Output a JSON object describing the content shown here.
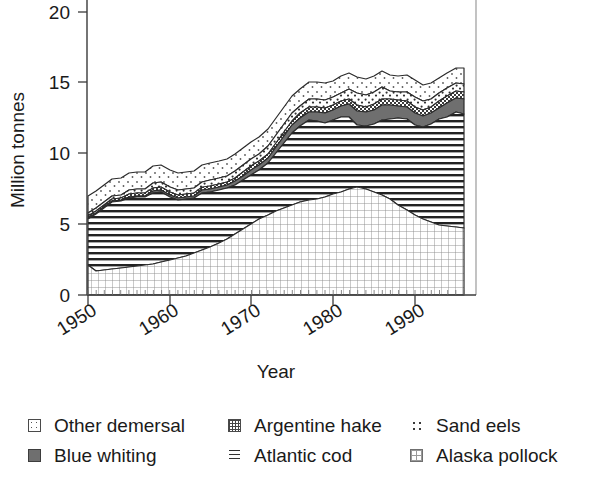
{
  "chart_data": {
    "type": "area",
    "stacked": true,
    "title": "",
    "xlabel": "Year",
    "ylabel": "Million tonnes",
    "xlim": [
      1950,
      1996
    ],
    "ylim": [
      0,
      21.5
    ],
    "yticks": [
      0,
      5,
      10,
      15,
      20
    ],
    "xticks": [
      1950,
      1960,
      1970,
      1980,
      1990
    ],
    "grid": false,
    "legend_position": "below",
    "x": [
      1950,
      1951,
      1952,
      1953,
      1954,
      1955,
      1956,
      1957,
      1958,
      1959,
      1960,
      1961,
      1962,
      1963,
      1964,
      1965,
      1966,
      1967,
      1968,
      1969,
      1970,
      1971,
      1972,
      1973,
      1974,
      1975,
      1976,
      1977,
      1978,
      1979,
      1980,
      1981,
      1982,
      1983,
      1984,
      1985,
      1986,
      1987,
      1988,
      1989,
      1990,
      1991,
      1992,
      1993,
      1994,
      1995,
      1996
    ],
    "series": [
      {
        "name": "Alaska pollock",
        "pattern": "fine-grid",
        "values": [
          0.0,
          0.0,
          0.0,
          0.0,
          0.0,
          0.0,
          0.05,
          0.1,
          0.1,
          0.15,
          0.2,
          0.3,
          0.4,
          0.5,
          0.6,
          0.7,
          0.8,
          1.0,
          1.3,
          1.6,
          2.0,
          2.4,
          2.8,
          3.1,
          3.3,
          3.5,
          3.5,
          3.4,
          3.4,
          3.5,
          3.7,
          4.0,
          4.3,
          4.6,
          5.0,
          5.4,
          5.9,
          6.4,
          6.7,
          6.3,
          5.8,
          5.3,
          5.0,
          4.8,
          4.6,
          4.6,
          4.7
        ]
      },
      {
        "name": "Atlantic cod",
        "pattern": "horizontal-lines",
        "values": [
          2.1,
          2.2,
          2.3,
          2.2,
          2.3,
          2.4,
          2.5,
          2.4,
          2.4,
          2.5,
          2.6,
          2.7,
          2.8,
          2.9,
          3.0,
          3.1,
          3.1,
          3.2,
          3.3,
          3.0,
          3.1,
          3.0,
          2.9,
          2.7,
          2.6,
          2.6,
          2.5,
          2.3,
          2.2,
          2.1,
          2.0,
          2.0,
          2.1,
          2.2,
          2.3,
          2.2,
          2.1,
          2.0,
          1.9,
          1.8,
          1.7,
          1.6,
          1.4,
          1.2,
          1.1,
          1.0,
          1.0
        ]
      },
      {
        "name": "Blue whiting",
        "pattern": "solid-gray",
        "values": [
          0.0,
          0.0,
          0.0,
          0.0,
          0.0,
          0.0,
          0.0,
          0.0,
          0.0,
          0.0,
          0.05,
          0.05,
          0.1,
          0.1,
          0.1,
          0.15,
          0.2,
          0.2,
          0.25,
          0.3,
          0.3,
          0.4,
          0.5,
          0.6,
          0.7,
          0.7,
          0.6,
          0.5,
          0.5,
          0.6,
          0.7,
          0.8,
          0.9,
          1.0,
          1.0,
          0.9,
          0.9,
          1.0,
          1.1,
          1.0,
          0.9,
          0.8,
          0.8,
          0.8,
          0.9,
          1.0,
          1.1
        ]
      },
      {
        "name": "Argentine hake",
        "pattern": "checkered",
        "values": [
          0.05,
          0.05,
          0.05,
          0.05,
          0.1,
          0.1,
          0.1,
          0.1,
          0.1,
          0.1,
          0.1,
          0.1,
          0.1,
          0.15,
          0.15,
          0.15,
          0.2,
          0.2,
          0.2,
          0.2,
          0.25,
          0.25,
          0.3,
          0.3,
          0.3,
          0.3,
          0.35,
          0.35,
          0.35,
          0.35,
          0.4,
          0.4,
          0.4,
          0.4,
          0.4,
          0.4,
          0.4,
          0.4,
          0.45,
          0.45,
          0.45,
          0.45,
          0.45,
          0.45,
          0.5,
          0.5,
          0.5
        ]
      },
      {
        "name": "Sand eels",
        "pattern": "sparse-dots",
        "values": [
          0.05,
          0.05,
          0.05,
          0.05,
          0.05,
          0.05,
          0.1,
          0.1,
          0.1,
          0.1,
          0.15,
          0.15,
          0.2,
          0.2,
          0.25,
          0.3,
          0.35,
          0.4,
          0.45,
          0.5,
          0.5,
          0.55,
          0.6,
          0.6,
          0.6,
          0.6,
          0.6,
          0.6,
          0.6,
          0.6,
          0.6,
          0.6,
          0.6,
          0.65,
          0.7,
          0.75,
          0.8,
          0.85,
          0.85,
          0.8,
          0.7,
          0.65,
          0.6,
          0.6,
          0.6,
          0.6,
          0.6
        ]
      },
      {
        "name": "Other demersal",
        "pattern": "light-dots",
        "values": [
          3.3,
          3.6,
          3.9,
          4.2,
          4.3,
          4.6,
          4.7,
          4.7,
          5.1,
          5.2,
          4.8,
          4.6,
          4.7,
          4.8,
          5.3,
          5.5,
          5.7,
          5.8,
          6.1,
          6.5,
          7.0,
          7.3,
          7.8,
          8.5,
          9.3,
          10.1,
          10.7,
          11.2,
          11.2,
          11.1,
          11.2,
          11.6,
          11.8,
          11.5,
          11.3,
          11.5,
          11.8,
          11.5,
          11.3,
          11.3,
          10.9,
          10.5,
          10.6,
          11.0,
          11.5,
          11.9,
          11.9
        ]
      }
    ],
    "total_note": "Stacked total peaks above 20 million tonnes around 1988-1989"
  },
  "axes": {
    "ylabel": "Million tonnes",
    "xlabel": "Year",
    "ytick_labels": [
      "0",
      "5",
      "10",
      "15",
      "20"
    ],
    "xtick_labels": [
      "1950",
      "1960",
      "1970",
      "1980",
      "1990"
    ]
  },
  "legend": {
    "rows": [
      [
        {
          "label": "Other demersal",
          "swatch": "sw-other",
          "icon": "legend-swatch-other-demersal"
        },
        {
          "label": "Argentine hake",
          "swatch": "sw-hake",
          "icon": "legend-swatch-argentine-hake"
        },
        {
          "label": "Sand eels",
          "swatch": "sw-sandeels",
          "icon": "legend-swatch-sand-eels"
        }
      ],
      [
        {
          "label": "Blue whiting",
          "swatch": "sw-bluewhiting",
          "icon": "legend-swatch-blue-whiting"
        },
        {
          "label": "Atlantic cod",
          "swatch": "sw-cod",
          "icon": "legend-swatch-atlantic-cod"
        },
        {
          "label": "Alaska pollock",
          "swatch": "sw-pollock",
          "icon": "legend-swatch-alaska-pollock"
        }
      ]
    ]
  },
  "colors": {
    "axis": "#3a3a3a",
    "outline": "#2b2b2b",
    "blue_whiting_fill": "#6f6f6f",
    "background": "#ffffff",
    "text": "#1a1a1a"
  }
}
